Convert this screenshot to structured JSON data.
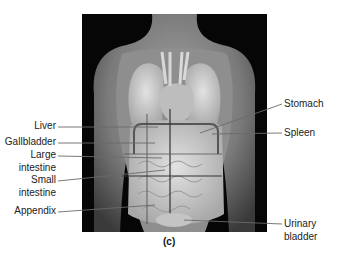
{
  "figure": {
    "caption": "(c)"
  },
  "labels_left": [
    {
      "id": "liver",
      "text": "Liver"
    },
    {
      "id": "gallbladder",
      "text": "Gallbladder"
    },
    {
      "id": "large_intestine_1",
      "text": "Large"
    },
    {
      "id": "large_intestine_2",
      "text": "intestine"
    },
    {
      "id": "small_intestine_1",
      "text": "Small"
    },
    {
      "id": "small_intestine_2",
      "text": "intestine"
    },
    {
      "id": "appendix",
      "text": "Appendix"
    }
  ],
  "labels_right": [
    {
      "id": "stomach",
      "text": "Stomach"
    },
    {
      "id": "spleen",
      "text": "Spleen"
    },
    {
      "id": "urinary_bladder_1",
      "text": "Urinary"
    },
    {
      "id": "urinary_bladder_2",
      "text": "bladder"
    }
  ],
  "colors": {
    "background": "#ffffff",
    "frame": "#060606",
    "skin": "#8a8a8a",
    "organs": "#cfcfcf",
    "leader_lines": "#666666",
    "label_text": "#222222"
  }
}
